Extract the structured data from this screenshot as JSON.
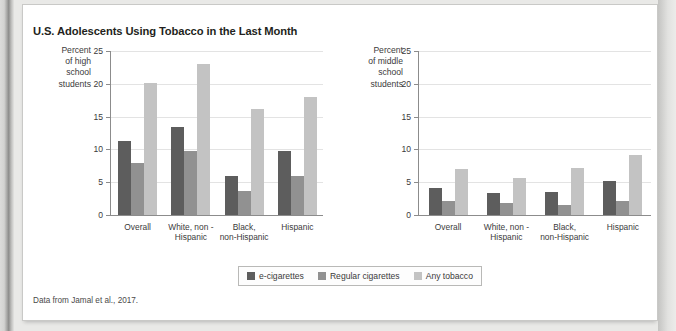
{
  "figure": {
    "title": "U.S. Adolescents Using Tobacco in the Last Month",
    "source": "Data from Jamal et al., 2017."
  },
  "legend": {
    "items": [
      {
        "label": "e-cigarettes",
        "color": "#5d5d5d"
      },
      {
        "label": "Regular cigarettes",
        "color": "#919191"
      },
      {
        "label": "Any tobacco",
        "color": "#c3c3c3"
      }
    ]
  },
  "axis": {
    "ticks": [
      0,
      5,
      10,
      15,
      20,
      25
    ],
    "tick_labels": [
      "0",
      "5",
      "10",
      "15",
      "20",
      "25"
    ]
  },
  "chart_data": [
    {
      "type": "bar",
      "title": "U.S. Adolescents Using Tobacco in the Last Month",
      "subplot": "high-school",
      "ylabel": "Percent of high school students",
      "ylabel_lines": [
        "Percent",
        "of high",
        "school",
        "students"
      ],
      "xlabel": "",
      "ylim": [
        0,
        25
      ],
      "yticks": [
        0,
        5,
        10,
        15,
        20,
        25
      ],
      "grid": true,
      "legend_position": "bottom-center",
      "categories": [
        "Overall",
        "White, non -\nHispanic",
        "Black,\nnon-Hispanic",
        "Hispanic"
      ],
      "category_lines": [
        [
          "Overall"
        ],
        [
          "White, non -",
          "Hispanic"
        ],
        [
          "Black,",
          "non-Hispanic"
        ],
        [
          "Hispanic"
        ]
      ],
      "series": [
        {
          "name": "e-cigarettes",
          "color": "#5d5d5d",
          "values": [
            11.3,
            13.4,
            5.9,
            9.8
          ]
        },
        {
          "name": "Regular cigarettes",
          "color": "#919191",
          "values": [
            7.9,
            9.7,
            3.7,
            6.0
          ]
        },
        {
          "name": "Any tobacco",
          "color": "#c3c3c3",
          "values": [
            20.2,
            23.0,
            16.2,
            18.0
          ]
        }
      ]
    },
    {
      "type": "bar",
      "subplot": "middle-school",
      "ylabel": "Percent of middle school students",
      "ylabel_lines": [
        "Percent",
        "of middle",
        "school",
        "students"
      ],
      "xlabel": "",
      "ylim": [
        0,
        25
      ],
      "yticks": [
        0,
        5,
        10,
        15,
        20,
        25
      ],
      "grid": true,
      "categories": [
        "Overall",
        "White, non -\nHispanic",
        "Black,\nnon-Hispanic",
        "Hispanic"
      ],
      "category_lines": [
        [
          "Overall"
        ],
        [
          "White, non -",
          "Hispanic"
        ],
        [
          "Black,",
          "non-Hispanic"
        ],
        [
          "Hispanic"
        ]
      ],
      "series": [
        {
          "name": "e-cigarettes",
          "color": "#5d5d5d",
          "values": [
            4.1,
            3.4,
            3.5,
            5.2
          ]
        },
        {
          "name": "Regular cigarettes",
          "color": "#919191",
          "values": [
            2.2,
            1.8,
            1.6,
            2.2
          ]
        },
        {
          "name": "Any tobacco",
          "color": "#c3c3c3",
          "values": [
            7.0,
            5.6,
            7.1,
            9.2
          ]
        }
      ]
    }
  ]
}
